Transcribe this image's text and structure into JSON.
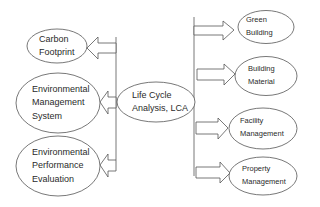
{
  "diagram": {
    "type": "concept-map",
    "colors": {
      "stroke": "#555555",
      "text": "#2a2a2a",
      "background": "#ffffff"
    },
    "center_node": {
      "id": "lca",
      "lines": [
        "Life Cycle",
        "Analysis, LCA"
      ]
    },
    "left_nodes": [
      {
        "id": "carbon-footprint",
        "lines": [
          "Carbon",
          "Footprint"
        ]
      },
      {
        "id": "environmental-management-system",
        "lines": [
          "Environmental",
          "Management",
          "System"
        ]
      },
      {
        "id": "environmental-performance-evaluation",
        "lines": [
          "Environmental",
          "Performance",
          "Evaluation"
        ]
      }
    ],
    "right_nodes": [
      {
        "id": "green-building",
        "lines": [
          "Green",
          "Building"
        ]
      },
      {
        "id": "building-material",
        "lines": [
          "Building",
          "Material"
        ]
      },
      {
        "id": "facility-management",
        "lines": [
          "Facility",
          "Management"
        ]
      },
      {
        "id": "property-management",
        "lines": [
          "Property",
          "Management"
        ]
      }
    ],
    "edges": [
      {
        "from": "lca",
        "to": "carbon-footprint",
        "style": "block-arrow"
      },
      {
        "from": "lca",
        "to": "environmental-management-system",
        "style": "block-arrow"
      },
      {
        "from": "lca",
        "to": "environmental-performance-evaluation",
        "style": "block-arrow"
      },
      {
        "from": "lca",
        "to": "green-building",
        "style": "block-arrow"
      },
      {
        "from": "lca",
        "to": "building-material",
        "style": "block-arrow"
      },
      {
        "from": "lca",
        "to": "facility-management",
        "style": "block-arrow"
      },
      {
        "from": "lca",
        "to": "property-management",
        "style": "block-arrow"
      }
    ]
  }
}
